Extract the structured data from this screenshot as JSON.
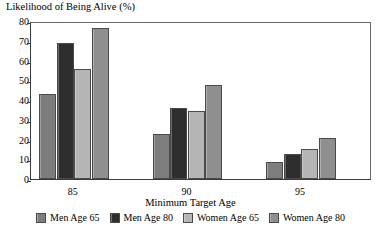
{
  "chart_data": {
    "type": "bar",
    "title": "",
    "ylabel": "Likelihood of Being Alive (%)",
    "xlabel": "Minimum Target Age",
    "categories": [
      "85",
      "90",
      "95"
    ],
    "ylim": [
      0,
      80
    ],
    "yticks": [
      0,
      10,
      20,
      30,
      40,
      50,
      60,
      70,
      80
    ],
    "grid": false,
    "legend_position": "bottom",
    "series": [
      {
        "name": "Men Age 65",
        "color": "#7d7d7d",
        "values": [
          43,
          23,
          8.5
        ]
      },
      {
        "name": "Men Age 80",
        "color": "#2e2e2e",
        "values": [
          69,
          36,
          12.5
        ]
      },
      {
        "name": "Women Age 65",
        "color": "#b5b5b5",
        "values": [
          55.5,
          34.5,
          15
        ]
      },
      {
        "name": "Women Age 80",
        "color": "#8f8f8f",
        "values": [
          76.5,
          47.5,
          21
        ]
      }
    ]
  },
  "axis": {
    "y_caption": "Likelihood of Being Alive (%)",
    "x_caption": "Minimum Target Age",
    "y_tick_labels": [
      "80",
      "70",
      "60",
      "50",
      "40",
      "30",
      "20",
      "10",
      "0"
    ],
    "x_tick_labels": [
      "85",
      "90",
      "95"
    ]
  },
  "legend": {
    "items": [
      {
        "label": "Men Age 65",
        "swatch": "#7d7d7d"
      },
      {
        "label": "Men Age 80",
        "swatch": "#2e2e2e"
      },
      {
        "label": "Women Age 65",
        "swatch": "#b5b5b5"
      },
      {
        "label": "Women Age 80",
        "swatch": "#8f8f8f"
      }
    ]
  }
}
